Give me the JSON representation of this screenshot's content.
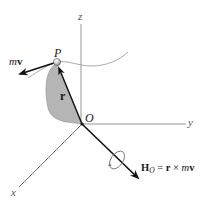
{
  "diagram": {
    "axes": {
      "x_label": "x",
      "y_label": "y",
      "z_label": "z"
    },
    "origin_label": "O",
    "particle_label": "P",
    "position_vector_label": "r",
    "momentum_label": {
      "scalar": "m",
      "vector": "v"
    },
    "angular_momentum_label": {
      "symbol": "H",
      "subscript": "O",
      "equals": "=",
      "r": "r",
      "cross": "×",
      "m": "m",
      "v": "v"
    },
    "colors": {
      "axis": "#7a7a7a",
      "vector": "#111111",
      "shaded_region": "#b5b5b5",
      "trajectory": "#9a9a9a",
      "particle": "#cfcfcf"
    }
  }
}
